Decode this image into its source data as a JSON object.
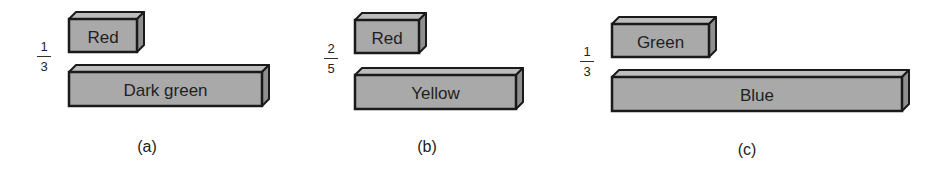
{
  "figure": {
    "style": {
      "front_face": "#a9a9a9",
      "top_face": "#bdbdbd",
      "side_face": "#8f8f8f",
      "outline": "#1a1a1a"
    },
    "panels": [
      {
        "id": "a",
        "caption": "(a)",
        "fraction": {
          "numerator": "1",
          "denominator": "3"
        },
        "short_rod": {
          "label": "Red",
          "x": 69,
          "y": 19,
          "w": 68,
          "h": 33
        },
        "long_rod": {
          "label": "Dark green",
          "x": 69,
          "y": 72,
          "w": 193,
          "h": 34
        },
        "fraction_pos": {
          "x": 37,
          "y": 40
        },
        "caption_pos": {
          "x": 147,
          "y": 138
        }
      },
      {
        "id": "b",
        "caption": "(b)",
        "fraction": {
          "numerator": "2",
          "denominator": "5"
        },
        "short_rod": {
          "label": "Red",
          "x": 355,
          "y": 20,
          "w": 64,
          "h": 33
        },
        "long_rod": {
          "label": "Yellow",
          "x": 355,
          "y": 75,
          "w": 161,
          "h": 34
        },
        "fraction_pos": {
          "x": 324,
          "y": 42
        },
        "caption_pos": {
          "x": 427,
          "y": 138
        }
      },
      {
        "id": "c",
        "caption": "(c)",
        "fraction": {
          "numerator": "1",
          "denominator": "3"
        },
        "short_rod": {
          "label": "Green",
          "x": 612,
          "y": 24,
          "w": 97,
          "h": 33
        },
        "long_rod": {
          "label": "Blue",
          "x": 612,
          "y": 77,
          "w": 290,
          "h": 34
        },
        "fraction_pos": {
          "x": 580,
          "y": 45
        },
        "caption_pos": {
          "x": 747,
          "y": 141
        }
      }
    ]
  }
}
